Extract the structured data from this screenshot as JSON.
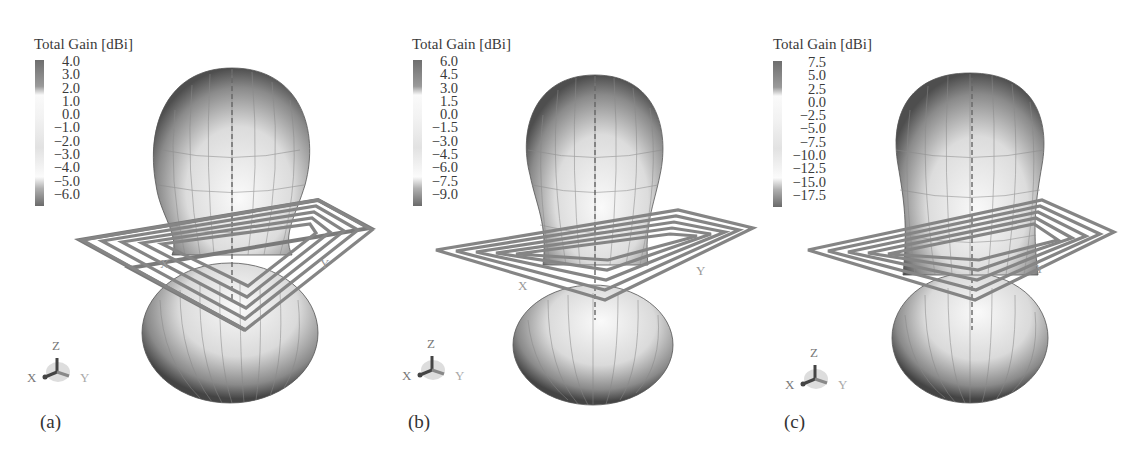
{
  "figure": {
    "panels": [
      {
        "id": "a",
        "label": "(a)",
        "legend_title": "Total Gain [dBi]",
        "ticks": [
          "4.0",
          "3.0",
          "2.0",
          "1.0",
          "0.0",
          "−1.0",
          "−2.0",
          "−3.0",
          "−4.0",
          "−5.0",
          "−6.0"
        ],
        "axis_labels": {
          "x": "X",
          "y": "Y",
          "z": "Z"
        }
      },
      {
        "id": "b",
        "label": "(b)",
        "legend_title": "Total Gain [dBi]",
        "ticks": [
          "6.0",
          "4.5",
          "3.0",
          "1.5",
          "0.0",
          "−1.5",
          "−3.0",
          "−4.5",
          "−6.0",
          "−7.5",
          "−9.0"
        ],
        "axis_labels": {
          "x": "X",
          "y": "Y",
          "z": "Z"
        }
      },
      {
        "id": "c",
        "label": "(c)",
        "legend_title": "Total Gain [dBi]",
        "ticks": [
          "7.5",
          "5.0",
          "2.5",
          "0.0",
          "−2.5",
          "−5.0",
          "−7.5",
          "−10.0",
          "−12.5",
          "−15.0",
          "−17.5"
        ],
        "axis_labels": {
          "x": "X",
          "y": "Y",
          "z": "Z"
        }
      }
    ],
    "colors": {
      "surface_dark": "#4a4a4a",
      "surface_light": "#f2f2f2",
      "trace": "#7a7a7a",
      "text": "#3a3a3a"
    }
  }
}
